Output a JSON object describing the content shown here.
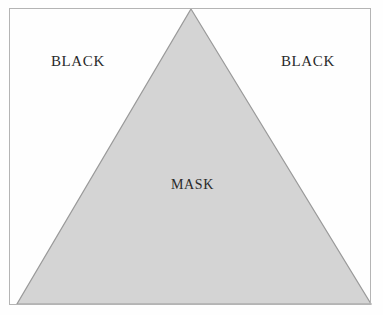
{
  "figure": {
    "kind": "geometric-diagram",
    "background_color": "#ffffff",
    "frame": {
      "border_color": "#b4b4b4",
      "left": 9,
      "top": 8,
      "width": 362,
      "height": 297
    },
    "triangle": {
      "name": "mask-triangle",
      "fill_color": "#d4d4d4",
      "stroke_color": "#9a9a9a",
      "apex": [
        191,
        9
      ],
      "base_left": [
        17,
        304
      ],
      "base_right": [
        371,
        304
      ]
    },
    "labels": {
      "black_left": "BLACK",
      "black_right": "BLACK",
      "mask_center": "MASK"
    },
    "caption_fragment": "",
    "text_color": "#2a2a2a"
  }
}
